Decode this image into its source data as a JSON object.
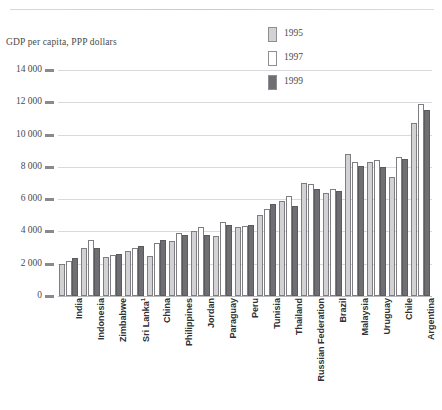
{
  "figure": {
    "axis_caption": "GDP per capita, PPP dollars",
    "top_rule": true
  },
  "legend": {
    "position": "top-center-right",
    "items": [
      {
        "label": "1995",
        "color": "#d2d2d4",
        "swatch_name": "legend-swatch-1995"
      },
      {
        "label": "1997",
        "color": "#ffffff",
        "swatch_name": "legend-swatch-1997"
      },
      {
        "label": "1999",
        "color": "#6e6e73",
        "swatch_name": "legend-swatch-1999"
      }
    ]
  },
  "yaxis": {
    "ticks": [
      "14 000",
      "12 000",
      "10 000",
      "8 000",
      "6 000",
      "4 000",
      "2 000",
      "0"
    ],
    "tick_values": [
      14000,
      12000,
      10000,
      8000,
      6000,
      4000,
      2000,
      0
    ]
  },
  "chart_data": {
    "type": "bar",
    "title": "GDP per capita, PPP dollars",
    "xlabel": "",
    "ylabel": "GDP per capita, PPP dollars",
    "ylim": [
      0,
      14000
    ],
    "ytick_labels": [
      "0",
      "2 000",
      "4 000",
      "6 000",
      "8 000",
      "10 000",
      "12 000",
      "14 000"
    ],
    "grid": true,
    "legend_position": "top right",
    "categories": [
      "India",
      "Indonesia",
      "Zimbabwe",
      "Sri Lanka¹",
      "China",
      "Philippines",
      "Jordan",
      "Paraguay",
      "Peru",
      "Tunisia",
      "Thailand",
      "Russian Federation",
      "Brazil",
      "Malaysia",
      "Uruguay",
      "Chile",
      "Argentina"
    ],
    "category_notes": {
      "Sri Lanka¹": "1"
    },
    "series": [
      {
        "name": "1995",
        "color": "#d2d2d4",
        "values": [
          2000,
          3000,
          2400,
          2800,
          2500,
          3400,
          4000,
          3700,
          4300,
          5000,
          5900,
          7000,
          6400,
          8800,
          8300,
          7400,
          10700
        ]
      },
      {
        "name": "1997",
        "color": "#ffffff",
        "values": [
          2150,
          3450,
          2550,
          2950,
          3300,
          3900,
          4300,
          4600,
          4350,
          5400,
          6200,
          6950,
          6600,
          8300,
          8400,
          8600,
          11900
        ]
      },
      {
        "name": "1999",
        "color": "#6e6e73",
        "values": [
          2350,
          2950,
          2600,
          3100,
          3500,
          3750,
          3800,
          4400,
          4400,
          5700,
          5600,
          6600,
          6500,
          8050,
          8000,
          8500,
          11500
        ]
      }
    ]
  }
}
